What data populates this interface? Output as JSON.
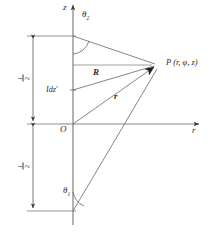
{
  "figure": {
    "type": "geometry-diagram",
    "background_color": "#ffffff",
    "line_color": "#555555",
    "text_color": "#2b2b2b"
  },
  "axes": {
    "vertical": {
      "label": "z",
      "arrow": "up"
    },
    "horizontal": {
      "label": "r",
      "arrow": "right"
    },
    "origin_label": "O"
  },
  "labels": {
    "theta_top": {
      "base": "θ",
      "sub": "2"
    },
    "theta_bottom": {
      "base": "θ",
      "sub": "1"
    },
    "source_element": "Idz′",
    "vector_R": "R",
    "vector_r": "r",
    "point": "P (r, φ, z)"
  },
  "dimensions": [
    {
      "name": "upper-half-length",
      "numerator": "l",
      "denominator": "2"
    },
    {
      "name": "lower-half-length",
      "numerator": "l",
      "denominator": "2"
    }
  ]
}
